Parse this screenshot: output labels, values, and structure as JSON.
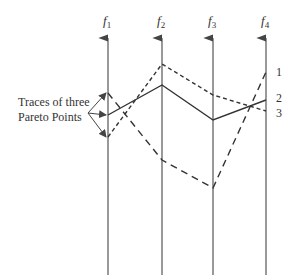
{
  "diagram": {
    "type": "parallel-coordinates",
    "caption_lines": [
      "Traces of three",
      "Pareto Points"
    ],
    "axes": [
      {
        "name": "f",
        "sub": "1",
        "x": 108
      },
      {
        "name": "f",
        "sub": "2",
        "x": 162
      },
      {
        "name": "f",
        "sub": "3",
        "x": 213
      },
      {
        "name": "f",
        "sub": "4",
        "x": 266
      }
    ],
    "traces": [
      {
        "label": "1",
        "style": "long-dash",
        "ys": [
          93,
          160,
          188,
          72
        ],
        "label_y": 76
      },
      {
        "label": "2",
        "style": "solid",
        "ys": [
          115,
          85,
          120,
          100
        ],
        "label_y": 102
      },
      {
        "label": "3",
        "style": "short-dash",
        "ys": [
          137,
          64,
          95,
          111
        ],
        "label_y": 117
      }
    ],
    "colors": {
      "line": "#333333",
      "axis": "#555555"
    }
  }
}
